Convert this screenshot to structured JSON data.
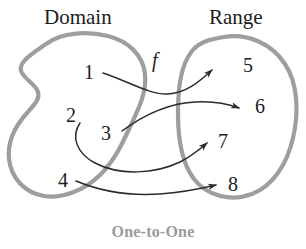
{
  "figure": {
    "caption": "One-to-One",
    "function_label": "f",
    "sets": {
      "domain": {
        "title": "Domain",
        "elements": [
          "1",
          "2",
          "3",
          "4"
        ]
      },
      "range": {
        "title": "Range",
        "elements": [
          "5",
          "6",
          "7",
          "8"
        ]
      }
    },
    "mappings": [
      {
        "from": "1",
        "to": "5"
      },
      {
        "from": "2",
        "to": "7"
      },
      {
        "from": "3",
        "to": "6"
      },
      {
        "from": "4",
        "to": "8"
      }
    ],
    "colors": {
      "blob_outline": "#9e9e9e",
      "arrow": "#2b2b2b",
      "text": "#1c1c1c",
      "caption": "#9b9b9b",
      "background": "#ffffff"
    }
  }
}
